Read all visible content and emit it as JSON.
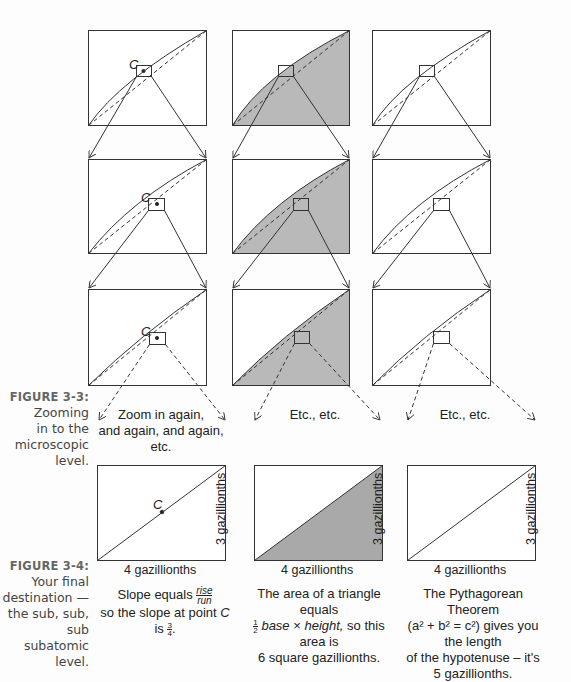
{
  "figure_3_3": {
    "label": "FIGURE 3-3:",
    "caption_lines": [
      "Zooming",
      "in to the",
      "microscopic",
      "level."
    ],
    "point_label": "C",
    "column_notes": [
      "Zoom in again,",
      "and again, and again, etc.",
      "Etc., etc.",
      "Etc., etc."
    ]
  },
  "figure_3_4": {
    "label": "FIGURE 3-4:",
    "caption_lines": [
      "Your final",
      "destination —",
      "the sub, sub,",
      "sub subatomic",
      "level."
    ],
    "point_label": "C",
    "panels": [
      {
        "base_label": "4 gazillionths",
        "height_label": "3 gazillionths",
        "text_1": "Slope equals",
        "frac_num": "rise",
        "frac_den": "run",
        "text_2a": "so the slope at point",
        "text_2b": "C",
        "text_2c": "is",
        "slope_num": "3",
        "slope_den": "4",
        "text_2d": "."
      },
      {
        "base_label": "4 gazillionths",
        "height_label": "3 gazillionths",
        "line_1": "The area of a triangle equals",
        "half_num": "1",
        "half_den": "2",
        "line_2a": "base",
        "line_2b": " × ",
        "line_2c": "height,",
        "line_2d": " so this area is",
        "line_3": "6 square gazillionths."
      },
      {
        "base_label": "4 gazillionths",
        "height_label": "3 gazillionths",
        "line_1": "The Pythagorean Theorem",
        "line_2": "(a² + b² = c²) gives you the length",
        "line_3": "of the hypotenuse – it's",
        "line_4": "5 gazillionths."
      }
    ]
  },
  "colors": {
    "line": "#333333",
    "shade": "#b8b8b8",
    "shade_dark": "#a8a8a8",
    "caption_label": "#666666"
  }
}
